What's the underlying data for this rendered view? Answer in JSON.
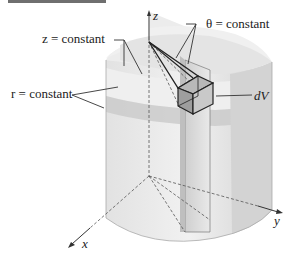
{
  "diagram": {
    "labels": {
      "z_surface": "z = constant",
      "theta_surface": "θ = constant",
      "r_surface": "r = constant",
      "volume_element": "dV",
      "axis_z": "z",
      "axis_x": "x",
      "axis_y": "y"
    },
    "colors": {
      "surface_light": "#e8e8e8",
      "surface_mid": "#d6d6d6",
      "surface_dark": "#bdbdbd",
      "band": "#c8c8c8",
      "line": "#333333",
      "dashed": "#555555",
      "topbar": "#6f6f6f"
    }
  }
}
